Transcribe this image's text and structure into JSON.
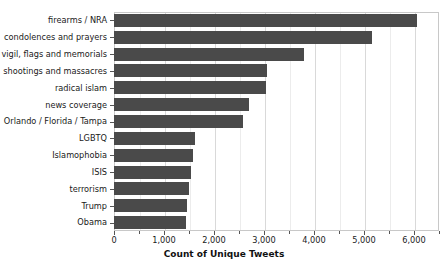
{
  "chart_data": {
    "type": "bar",
    "orientation": "horizontal",
    "title": "",
    "xlabel": "Count of Unique Tweets",
    "ylabel": "",
    "categories": [
      "firearms / NRA",
      "condolences and prayers",
      "vigil, flags and memorials",
      "shootings and massacres",
      "radical islam",
      "news coverage",
      "Orlando / Florida / Tampa",
      "LGBTQ",
      "Islamophobia",
      "ISIS",
      "terrorism",
      "Trump",
      "Obama"
    ],
    "values": [
      6050,
      5150,
      3800,
      3050,
      3030,
      2700,
      2580,
      1620,
      1580,
      1540,
      1490,
      1460,
      1430
    ],
    "xlim": [
      0,
      6500
    ],
    "xticks": [
      0,
      1000,
      2000,
      3000,
      4000,
      5000,
      6000
    ],
    "xticklabels": [
      "0",
      "1,000",
      "2,000",
      "3,000",
      "4,000",
      "5,000",
      "6,000"
    ],
    "xminorticks": [
      500,
      1500,
      2500,
      3500,
      4500,
      5500,
      6500
    ],
    "grid": true,
    "grid_axis": "x",
    "legend": false,
    "bar_color": "#4a4a4a",
    "grid_color": "#d9d9d9",
    "frame_color": "#c8c8c8",
    "background": "#ffffff"
  }
}
